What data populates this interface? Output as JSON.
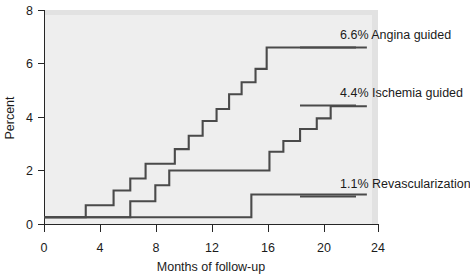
{
  "chart_data": {
    "type": "line",
    "title": "",
    "subtitle": "",
    "xlabel": "Months of follow-up",
    "ylabel": "Percent",
    "xlim": [
      0,
      24
    ],
    "ylim": [
      0,
      8
    ],
    "xticks": [
      "0",
      "4",
      "8",
      "12",
      "16",
      "20",
      "24"
    ],
    "xtick_values": [
      0,
      4,
      8,
      12,
      16,
      20,
      24
    ],
    "yticks": [
      "0",
      "2",
      "4",
      "6",
      "8"
    ],
    "ytick_values": [
      0,
      2,
      4,
      6,
      8
    ],
    "grid": false,
    "legend_position": "inline-right-annotations",
    "step_style": "post",
    "series": [
      {
        "name": "Angina guided",
        "annotation": "6.6% Angina guided",
        "final_value": 6.6,
        "color": "#4a4a4a",
        "x": [
          0,
          2.5,
          3.0,
          4.3,
          5.0,
          6.2,
          7.3,
          8.3,
          9.4,
          10.4,
          11.4,
          12.4,
          13.3,
          14.2,
          15.2,
          16.0,
          23.2
        ],
        "y": [
          0.25,
          0.25,
          0.7,
          0.7,
          1.25,
          1.7,
          2.25,
          2.25,
          2.8,
          3.3,
          3.85,
          4.3,
          4.85,
          5.3,
          5.8,
          6.6,
          6.6
        ]
      },
      {
        "name": "Ischemia guided",
        "annotation": "4.4% Ischemia guided",
        "final_value": 4.4,
        "color": "#4a4a4a",
        "x": [
          0,
          5.0,
          6.2,
          8.0,
          9.0,
          15.2,
          16.2,
          17.2,
          18.4,
          19.6,
          20.6,
          23.2
        ],
        "y": [
          0.25,
          0.25,
          0.85,
          1.45,
          2.0,
          2.0,
          2.7,
          3.1,
          3.55,
          3.95,
          4.4,
          4.4
        ]
      },
      {
        "name": "Revascularization",
        "annotation": "1.1% Revascularization",
        "final_value": 1.1,
        "color": "#4a4a4a",
        "x": [
          0,
          14.9,
          23.2
        ],
        "y": [
          0.25,
          0.25,
          1.1
        ],
        "y_alt": [
          0.25,
          1.1,
          1.1
        ]
      }
    ],
    "annotations": [
      {
        "text": "6.6% Angina guided",
        "series": "Angina guided"
      },
      {
        "text": "4.4% Ischemia guided",
        "series": "Ischemia guided"
      },
      {
        "text": "1.1% Revascularization",
        "series": "Revascularization"
      }
    ],
    "colors": {
      "curve": "#4a4a4a",
      "axis": "#262626",
      "plot_background": "#eeeeee",
      "page_background": "#ffffff",
      "text": "#1b1b1b"
    }
  }
}
